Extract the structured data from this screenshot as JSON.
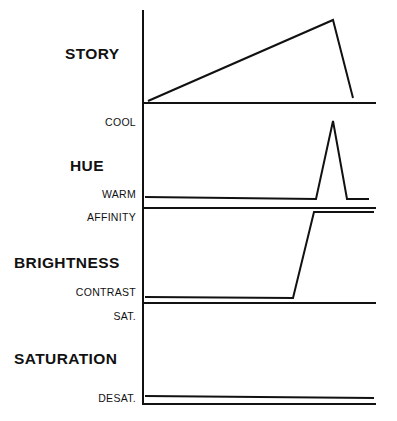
{
  "figure": {
    "title_visible": false,
    "background_color": "#ffffff",
    "line_color": "#111111",
    "axis_x": 143,
    "axis_top": 10,
    "axis_bottom": 405,
    "plot_right": 376
  },
  "sections": [
    {
      "id": "story",
      "name": "STORY",
      "label": "STORY",
      "label_x": 65,
      "label_y": 45,
      "axis_labels": []
    },
    {
      "id": "hue",
      "name": "HUE",
      "label": "HUE",
      "label_x": 70,
      "label_y": 157,
      "axis_labels": [
        {
          "text": "COOL",
          "y": 122
        },
        {
          "text": "WARM",
          "y": 194
        }
      ]
    },
    {
      "id": "brightness",
      "name": "BRIGHTNESS",
      "label": "BRIGHTNESS",
      "label_x": 14,
      "label_y": 254,
      "axis_labels": [
        {
          "text": "AFFINITY",
          "y": 217
        },
        {
          "text": "CONTRAST",
          "y": 292
        }
      ]
    },
    {
      "id": "saturation",
      "name": "SATURATION",
      "label": "SATURATION",
      "label_x": 14,
      "label_y": 350,
      "axis_labels": [
        {
          "text": "SAT.",
          "y": 316
        },
        {
          "text": "DESAT.",
          "y": 398
        }
      ]
    }
  ],
  "chart_data": {
    "type": "line",
    "title": "",
    "subtitle": "",
    "xlabel": "",
    "ylabel": "",
    "grid": false,
    "legend": "none",
    "axis": {
      "orientation": "vertical-left-spine",
      "x_position": 143,
      "y_top": 10,
      "y_bottom": 405,
      "x_end": 376,
      "ticks_visible": false
    },
    "panels": [
      {
        "name": "STORY",
        "row_label": "STORY",
        "y_tick_labels": [],
        "baseline_y": 103,
        "baseline_x": [
          143,
          376
        ],
        "series": [
          {
            "name": "story-arc",
            "description": "rises gradually from low-left to high peak near right, then drops steeply",
            "points": [
              {
                "x": 148,
                "y": 101
              },
              {
                "x": 333,
                "y": 20
              },
              {
                "x": 353,
                "y": 98
              }
            ]
          }
        ]
      },
      {
        "name": "HUE",
        "row_label": "HUE",
        "y_tick_labels": [
          {
            "text": "COOL",
            "y": 122
          },
          {
            "text": "WARM",
            "y": 194
          }
        ],
        "baseline_y": 208,
        "baseline_x": [
          143,
          376
        ],
        "series": [
          {
            "name": "hue-curve",
            "description": "flat at WARM then a sharp narrow spike up to COOL near the right, back to WARM",
            "points": [
              {
                "x": 145,
                "y": 197
              },
              {
                "x": 316,
                "y": 199
              },
              {
                "x": 333,
                "y": 121
              },
              {
                "x": 347,
                "y": 199
              },
              {
                "x": 369,
                "y": 199
              }
            ]
          }
        ]
      },
      {
        "name": "BRIGHTNESS",
        "row_label": "BRIGHTNESS",
        "y_tick_labels": [
          {
            "text": "AFFINITY",
            "y": 217
          },
          {
            "text": "CONTRAST",
            "y": 292
          }
        ],
        "baseline_y": 303,
        "baseline_x": [
          143,
          376
        ],
        "series": [
          {
            "name": "brightness-curve",
            "description": "flat at CONTRAST then steep rise to AFFINITY near the right, then flat",
            "points": [
              {
                "x": 145,
                "y": 297
              },
              {
                "x": 293,
                "y": 298
              },
              {
                "x": 314,
                "y": 212
              },
              {
                "x": 374,
                "y": 212
              }
            ]
          }
        ]
      },
      {
        "name": "SATURATION",
        "row_label": "SATURATION",
        "y_tick_labels": [
          {
            "text": "SAT.",
            "y": 316
          },
          {
            "text": "DESAT.",
            "y": 398
          }
        ],
        "baseline_y": 404,
        "baseline_x": [
          143,
          376
        ],
        "series": [
          {
            "name": "saturation-curve",
            "description": "flat line held at DESAT. for the full duration",
            "points": [
              {
                "x": 145,
                "y": 396
              },
              {
                "x": 374,
                "y": 398
              }
            ]
          }
        ]
      }
    ]
  }
}
